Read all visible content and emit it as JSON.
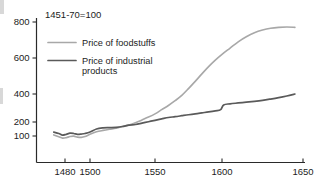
{
  "chart_data": {
    "type": "line",
    "title": "1451-70=100",
    "xlabel": "",
    "ylabel": "",
    "xlim": [
      1470,
      1650
    ],
    "ylim": [
      60,
      850
    ],
    "grid": false,
    "legend_position": "top-left-inside",
    "x_ticks": [
      1480,
      1500,
      1550,
      1600,
      1650
    ],
    "x_tick_labels": [
      "1480",
      "1500",
      "1550",
      "1600",
      "1650"
    ],
    "y_ticks": [
      100,
      200,
      400,
      600,
      800
    ],
    "y_tick_labels": [
      "100",
      "200",
      "400",
      "600",
      "800"
    ],
    "y_axis_note": "Non-linear spacing: compressed between 100 and 200",
    "series": [
      {
        "name": "Price of foodstuffs",
        "color": "#a8a8a8",
        "x": [
          1471,
          1475,
          1478,
          1481,
          1484,
          1487,
          1490,
          1493,
          1496,
          1500,
          1505,
          1510,
          1515,
          1520,
          1525,
          1530,
          1535,
          1540,
          1545,
          1550,
          1555,
          1560,
          1565,
          1570,
          1575,
          1580,
          1585,
          1590,
          1595,
          1600,
          1605,
          1610,
          1615,
          1620,
          1625,
          1630,
          1635,
          1640,
          1645
        ],
        "values": [
          108,
          95,
          85,
          88,
          96,
          99,
          92,
          90,
          96,
          112,
          130,
          140,
          148,
          155,
          168,
          178,
          195,
          215,
          235,
          258,
          288,
          318,
          352,
          390,
          430,
          470,
          512,
          552,
          588,
          620,
          655,
          690,
          718,
          740,
          755,
          765,
          770,
          772,
          770
        ]
      },
      {
        "name": "Price of industrial products",
        "color": "#5a5a5a",
        "x": [
          1471,
          1475,
          1478,
          1481,
          1484,
          1487,
          1490,
          1493,
          1496,
          1500,
          1505,
          1510,
          1515,
          1520,
          1525,
          1530,
          1535,
          1540,
          1545,
          1550,
          1555,
          1560,
          1565,
          1570,
          1575,
          1580,
          1585,
          1590,
          1595,
          1599,
          1601,
          1605,
          1610,
          1615,
          1620,
          1625,
          1630,
          1635,
          1640,
          1645
        ],
        "values": [
          128,
          118,
          106,
          112,
          120,
          118,
          112,
          114,
          118,
          128,
          150,
          158,
          160,
          162,
          168,
          178,
          182,
          192,
          202,
          212,
          222,
          232,
          238,
          245,
          252,
          258,
          265,
          272,
          280,
          288,
          322,
          330,
          336,
          342,
          348,
          355,
          364,
          374,
          386,
          400
        ]
      }
    ]
  },
  "legend": {
    "entries": [
      {
        "label_line1": "Price of foodstuffs",
        "label_line2": ""
      },
      {
        "label_line1": "Price of industrial",
        "label_line2": "products"
      }
    ]
  },
  "colors": {
    "foodstuffs": "#a8a8a8",
    "industrial": "#5a5a5a",
    "axis": "#2a2a2a",
    "text": "#1c1c1c",
    "background": "#ffffff"
  }
}
